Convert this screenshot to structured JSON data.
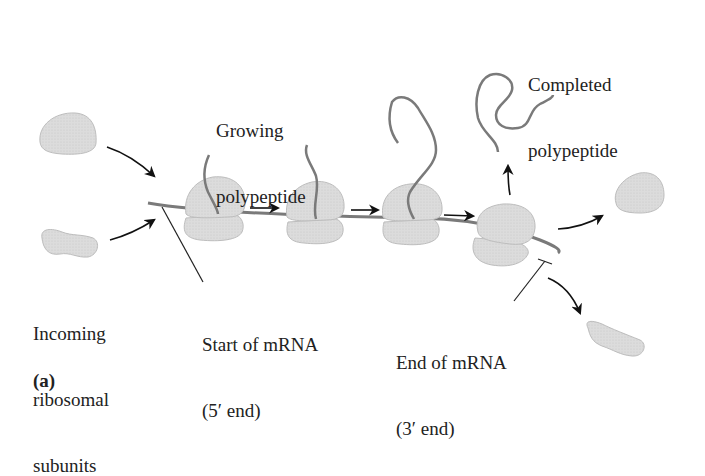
{
  "labels": {
    "growing": [
      "Growing",
      "polypeptide"
    ],
    "completed": [
      "Completed",
      "polypeptide"
    ],
    "incoming": [
      "Incoming",
      "ribosomal",
      "subunits"
    ],
    "start": [
      "Start of mRNA",
      "(5′ end)"
    ],
    "end": [
      "End of mRNA",
      "(3′ end)"
    ],
    "panel": "(a)"
  },
  "colors": {
    "ribosome_fill": "#d9d9d9",
    "ribosome_stroke": "#b5b5b5",
    "strand": "#7a7a7a",
    "arrow": "#111111",
    "text": "#222222"
  },
  "icons": {
    "ribosome": "ribosome-icon",
    "arrow": "arrow-icon",
    "mrna": "mrna-strand",
    "polypeptide": "polypeptide-strand"
  }
}
